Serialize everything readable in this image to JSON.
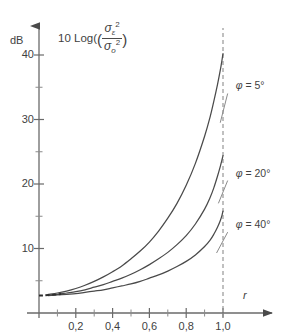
{
  "chart_data": {
    "type": "line",
    "title": "",
    "ylabel_parts": {
      "prefix": "10 Log(",
      "numerator_symbol": "σ",
      "numerator_sub": "ε",
      "numerator_exp": "2",
      "denominator_symbol": "σ",
      "denominator_sub": "o",
      "denominator_exp": "2",
      "suffix": ")"
    },
    "ylabel_text": "10 Log(σε²/σo²)",
    "yunit": "dB",
    "xlabel": "r",
    "xlim": [
      0,
      1.14
    ],
    "ylim": [
      0,
      44
    ],
    "xticks_major": [
      "0,2",
      "0,4",
      "0,6",
      "0,8",
      "1,0"
    ],
    "xticks_major_values": [
      0.2,
      0.4,
      0.6,
      0.8,
      1.0
    ],
    "xticks_minor_values": [
      0.1,
      0.3,
      0.5,
      0.7,
      0.9
    ],
    "yticks_major": [
      "10",
      "20",
      "30",
      "40"
    ],
    "yticks_major_values": [
      10,
      20,
      30,
      40
    ],
    "yticks_minor_values": [
      5,
      15,
      25,
      35
    ],
    "grid": false,
    "legend_position": "inline-right",
    "reference_line": {
      "x": 1.0,
      "style": "dashed",
      "label": ""
    },
    "series": [
      {
        "name": "φ = 5°",
        "label": "φ = 5°",
        "label_x": 1.02,
        "label_y": 34.5,
        "leader_to": [
          0.985,
          29.5
        ],
        "color": "#4a4a4a",
        "points": [
          [
            0.05,
            2.9
          ],
          [
            0.1,
            3.1
          ],
          [
            0.15,
            3.4
          ],
          [
            0.2,
            3.8
          ],
          [
            0.25,
            4.3
          ],
          [
            0.3,
            4.9
          ],
          [
            0.35,
            5.6
          ],
          [
            0.4,
            6.4
          ],
          [
            0.45,
            7.3
          ],
          [
            0.5,
            8.4
          ],
          [
            0.55,
            9.6
          ],
          [
            0.6,
            11.0
          ],
          [
            0.65,
            12.7
          ],
          [
            0.7,
            14.7
          ],
          [
            0.75,
            17.0
          ],
          [
            0.8,
            19.8
          ],
          [
            0.85,
            23.2
          ],
          [
            0.9,
            27.4
          ],
          [
            0.93,
            30.4
          ],
          [
            0.95,
            32.8
          ],
          [
            0.97,
            35.4
          ],
          [
            0.985,
            37.6
          ],
          [
            0.995,
            39.3
          ],
          [
            1.0,
            40.2
          ]
        ]
      },
      {
        "name": "φ = 20°",
        "label": "φ = 20°",
        "label_x": 1.02,
        "label_y": 21.0,
        "leader_to": [
          0.975,
          17.0
        ],
        "color": "#4a4a4a",
        "points": [
          [
            0.05,
            2.8
          ],
          [
            0.1,
            2.9
          ],
          [
            0.15,
            3.1
          ],
          [
            0.2,
            3.3
          ],
          [
            0.25,
            3.6
          ],
          [
            0.3,
            4.0
          ],
          [
            0.35,
            4.4
          ],
          [
            0.4,
            4.9
          ],
          [
            0.45,
            5.4
          ],
          [
            0.5,
            6.0
          ],
          [
            0.55,
            6.7
          ],
          [
            0.6,
            7.5
          ],
          [
            0.65,
            8.4
          ],
          [
            0.7,
            9.4
          ],
          [
            0.75,
            10.6
          ],
          [
            0.8,
            12.0
          ],
          [
            0.85,
            13.8
          ],
          [
            0.9,
            16.1
          ],
          [
            0.93,
            17.9
          ],
          [
            0.95,
            19.4
          ],
          [
            0.97,
            21.2
          ],
          [
            0.985,
            22.7
          ],
          [
            0.995,
            23.8
          ],
          [
            1.0,
            24.4
          ]
        ]
      },
      {
        "name": "φ = 40°",
        "label": "φ = 40°",
        "label_x": 1.02,
        "label_y": 13.0,
        "leader_to": [
          0.965,
          9.3
        ],
        "color": "#4a4a4a",
        "points": [
          [
            0.05,
            2.7
          ],
          [
            0.1,
            2.8
          ],
          [
            0.15,
            2.9
          ],
          [
            0.2,
            3.0
          ],
          [
            0.25,
            3.2
          ],
          [
            0.3,
            3.4
          ],
          [
            0.35,
            3.6
          ],
          [
            0.4,
            3.9
          ],
          [
            0.45,
            4.2
          ],
          [
            0.5,
            4.5
          ],
          [
            0.55,
            4.9
          ],
          [
            0.6,
            5.4
          ],
          [
            0.65,
            5.9
          ],
          [
            0.7,
            6.5
          ],
          [
            0.75,
            7.2
          ],
          [
            0.8,
            8.0
          ],
          [
            0.85,
            9.0
          ],
          [
            0.9,
            10.3
          ],
          [
            0.93,
            11.3
          ],
          [
            0.95,
            12.2
          ],
          [
            0.97,
            13.3
          ],
          [
            0.985,
            14.3
          ],
          [
            0.995,
            15.2
          ],
          [
            1.0,
            15.8
          ]
        ]
      }
    ],
    "dashed_extension": {
      "description": "dashed low-r continuation of the curve bundle toward the y-axis",
      "points": [
        [
          0.0,
          2.7
        ],
        [
          0.02,
          2.72
        ],
        [
          0.05,
          2.78
        ],
        [
          0.09,
          2.85
        ],
        [
          0.12,
          2.95
        ]
      ]
    }
  },
  "axes": {
    "x_axis_name": "r",
    "y_axis_unit": "dB"
  }
}
